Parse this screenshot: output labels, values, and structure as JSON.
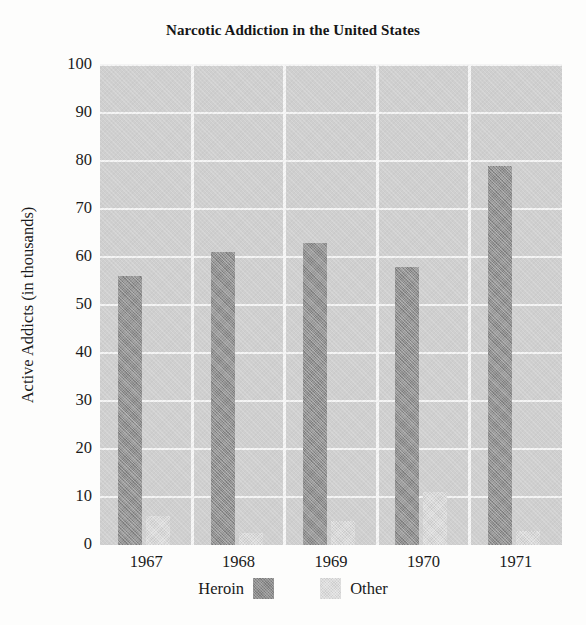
{
  "chart_data": {
    "type": "bar",
    "title": "Narcotic Addiction in the United States",
    "xlabel": "",
    "ylabel": "Active Addicts (in thousands)",
    "categories": [
      "1967",
      "1968",
      "1969",
      "1970",
      "1971"
    ],
    "series": [
      {
        "name": "Heroin",
        "color": "#8e8e8e",
        "values": [
          56,
          61,
          63,
          58,
          79
        ]
      },
      {
        "name": "Other",
        "color": "#d9d9d9",
        "values": [
          6,
          2.5,
          5,
          11,
          3
        ]
      }
    ],
    "ylim": [
      0,
      100
    ],
    "yticks": [
      "0",
      "10",
      "20",
      "30",
      "40",
      "50",
      "60",
      "70",
      "80",
      "90",
      "100"
    ],
    "ytick_values": [
      0,
      10,
      20,
      30,
      40,
      50,
      60,
      70,
      80,
      90,
      100
    ],
    "grid": "horizontal-and-vertical",
    "grid_color": "#f4f4f4",
    "plot_background": "#cfcfcf",
    "legend_position": "bottom",
    "legend_entries": [
      "Heroin",
      "Other"
    ]
  }
}
